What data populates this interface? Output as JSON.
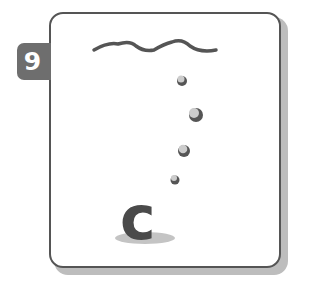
{
  "step_badge": {
    "number": "9",
    "color": "#6e6e6e"
  },
  "illustration": {
    "letter": "c",
    "letter_color": "#4a4a4a",
    "waves_color": "#555555",
    "bubbles": [
      {
        "cx": 181,
        "cy": 80,
        "r": 5
      },
      {
        "cx": 195,
        "cy": 114,
        "r": 7
      },
      {
        "cx": 183,
        "cy": 150,
        "r": 6
      },
      {
        "cx": 174,
        "cy": 179,
        "r": 4
      }
    ]
  }
}
